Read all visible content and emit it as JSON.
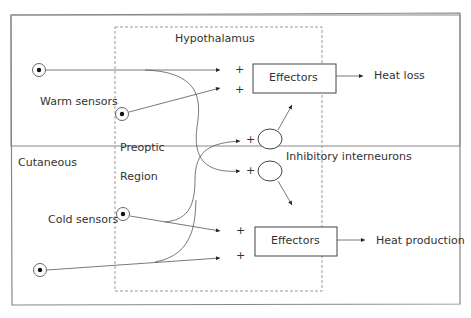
{
  "labels": {
    "hypothalamus": "Hypothalamus",
    "warm_sensors": "Warm sensors",
    "cold_sensors": "Cold sensors",
    "cutaneous": "Cutaneous",
    "preoptic": "Preoptic",
    "region": "Region",
    "inhibitory": "Inhibitory interneurons",
    "effectors_top": "Effectors",
    "effectors_bottom": "Effectors",
    "heat_loss": "Heat loss",
    "heat_production": "Heat production"
  },
  "signs": {
    "plus": "+"
  }
}
